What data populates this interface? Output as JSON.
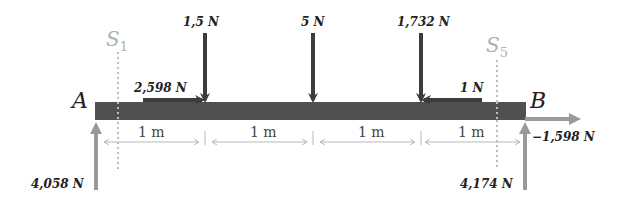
{
  "diagram": {
    "type": "beam-free-body-diagram",
    "beam": {
      "color": "#505050",
      "span_label": "4 × 1 m"
    },
    "points": [
      {
        "id": "A",
        "label": "A"
      },
      {
        "id": "B",
        "label": "B"
      }
    ],
    "sections": [
      {
        "id": "S1",
        "main": "S",
        "sub": "1"
      },
      {
        "id": "S5",
        "main": "S",
        "sub": "5"
      }
    ],
    "dimensions": [
      "1 m",
      "1 m",
      "1 m",
      "1 m"
    ],
    "applied_loads": [
      {
        "id": "load-1",
        "label": "1,5 N",
        "direction": "down"
      },
      {
        "id": "load-2",
        "label": "5 N",
        "direction": "down"
      },
      {
        "id": "load-3",
        "label": "1,732 N",
        "direction": "down"
      },
      {
        "id": "axial-left",
        "label": "2,598 N",
        "direction": "right"
      },
      {
        "id": "axial-right",
        "label": "1 N",
        "direction": "left"
      }
    ],
    "reactions": [
      {
        "id": "reaction-A-vertical",
        "label": "4,058 N",
        "direction": "up"
      },
      {
        "id": "reaction-B-vertical",
        "label": "4,174 N",
        "direction": "up"
      },
      {
        "id": "reaction-B-horizontal",
        "label": "−1,598 N",
        "direction": "right"
      }
    ],
    "colors": {
      "beam": "#505050",
      "applied": "#3c3c3c",
      "reaction": "#9a9a9a",
      "section": "#bdbdbd",
      "dimension": "#b8b8b8"
    }
  }
}
